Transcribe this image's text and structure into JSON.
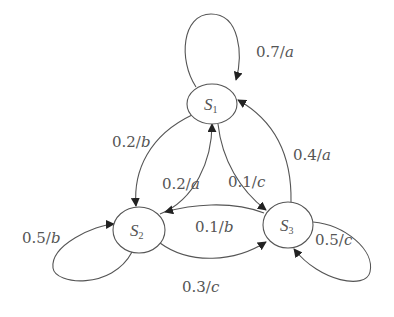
{
  "diagram": {
    "type": "state-transition",
    "states": [
      {
        "id": "S1",
        "name": "S",
        "sub": "1"
      },
      {
        "id": "S2",
        "name": "S",
        "sub": "2"
      },
      {
        "id": "S3",
        "name": "S",
        "sub": "3"
      }
    ],
    "transitions": [
      {
        "from": "S1",
        "to": "S1",
        "prob": "0.7",
        "sym": "a"
      },
      {
        "from": "S1",
        "to": "S2",
        "prob": "0.2",
        "sym": "b"
      },
      {
        "from": "S2",
        "to": "S1",
        "prob": "0.2",
        "sym": "a"
      },
      {
        "from": "S1",
        "to": "S3",
        "prob": "0.1",
        "sym": "c"
      },
      {
        "from": "S3",
        "to": "S1",
        "prob": "0.4",
        "sym": "a"
      },
      {
        "from": "S2",
        "to": "S2",
        "prob": "0.5",
        "sym": "b"
      },
      {
        "from": "S3",
        "to": "S2",
        "prob": "0.1",
        "sym": "b"
      },
      {
        "from": "S3",
        "to": "S3",
        "prob": "0.5",
        "sym": "c"
      },
      {
        "from": "S2",
        "to": "S3",
        "prob": "0.3",
        "sym": "c"
      }
    ],
    "separator": "/",
    "colors": {
      "stroke": "#555555",
      "text": "#555555",
      "background": "#ffffff"
    }
  }
}
